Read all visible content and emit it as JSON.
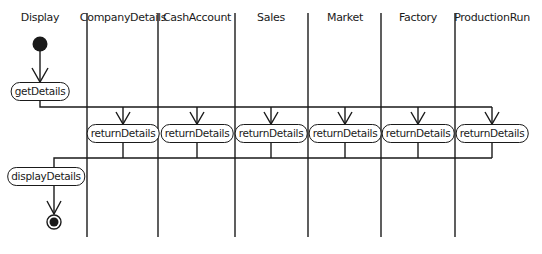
{
  "diagram": {
    "type": "UML activity diagram with swimlanes",
    "lanes": [
      {
        "label": "Display",
        "center_x": 40
      },
      {
        "label": "CompanyDetails",
        "center_x": 123
      },
      {
        "label": "CashAccount",
        "center_x": 197
      },
      {
        "label": "Sales",
        "center_x": 271
      },
      {
        "label": "Market",
        "center_x": 345
      },
      {
        "label": "Factory",
        "center_x": 418
      },
      {
        "label": "ProductionRun",
        "center_x": 492
      }
    ],
    "activities": {
      "get_details": "getDetails",
      "return_details": "returnDetails",
      "display_details": "displayDetails"
    },
    "nodes": {
      "initial": "initial-node",
      "final": "final-node"
    }
  }
}
